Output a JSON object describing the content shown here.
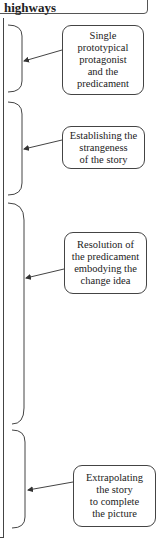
{
  "header": {
    "text": "highways"
  },
  "stages": [
    {
      "label": "Single\nprototypical\nprotagonist\nand the\npredicament"
    },
    {
      "label": "Establishing the\nstrangeness\nof the story"
    },
    {
      "label": "Resolution of\nthe predicament\nembodying the\nchange idea"
    },
    {
      "label": "Extrapolating\nthe story\nto complete\nthe picture"
    }
  ],
  "colors": {
    "line": "#444444",
    "background": "#ffffff"
  }
}
